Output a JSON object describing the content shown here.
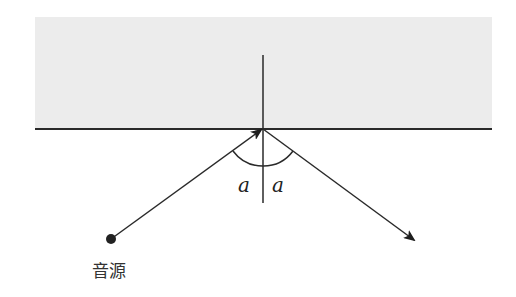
{
  "diagram": {
    "labels": {
      "angle_incident": "a",
      "angle_reflected": "a",
      "source": "音源"
    },
    "colors": {
      "surface_fill": "#ececec",
      "line": "#2a2a2a"
    }
  }
}
